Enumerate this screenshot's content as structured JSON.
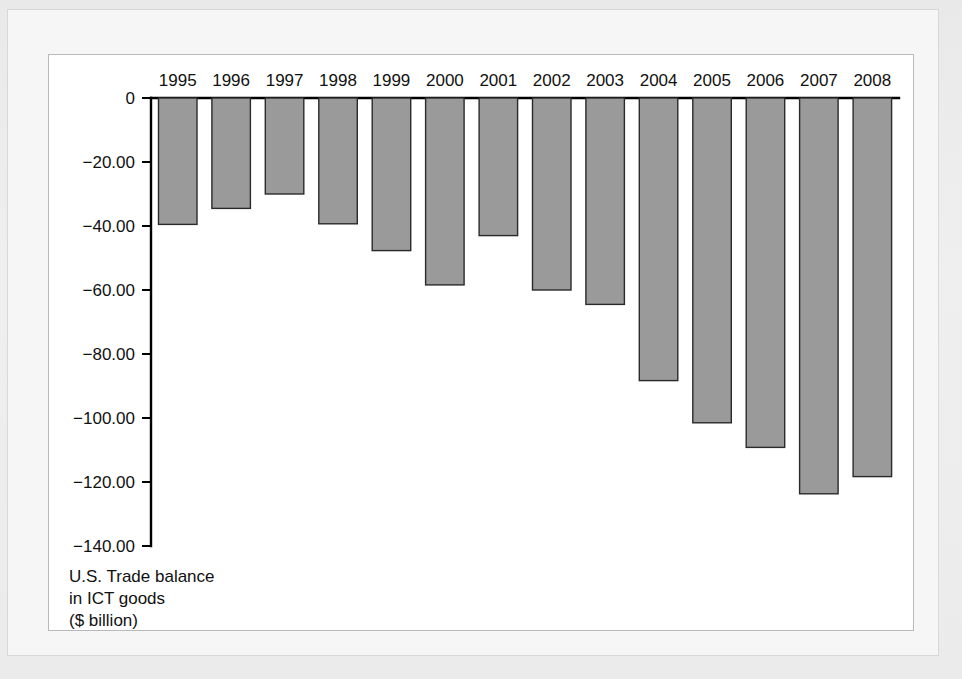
{
  "chart_data": {
    "type": "bar",
    "title": "",
    "subtitle": "",
    "caption_lines": [
      "U.S. Trade balance",
      "in ICT goods",
      "($ billion)"
    ],
    "xlabel": "",
    "ylabel": "",
    "categories": [
      "1995",
      "1996",
      "1997",
      "1998",
      "1999",
      "2000",
      "2001",
      "2002",
      "2003",
      "2004",
      "2005",
      "2006",
      "2007",
      "2008"
    ],
    "values": [
      -39.5,
      -34.5,
      -30.0,
      -39.3,
      -47.7,
      -58.4,
      -43.0,
      -60.0,
      -64.5,
      -88.3,
      -101.5,
      -109.2,
      -123.7,
      -118.3
    ],
    "ylim": [
      -140,
      0
    ],
    "ytick_values": [
      0,
      -20,
      -40,
      -60,
      -80,
      -100,
      -120,
      -140
    ],
    "ytick_labels": [
      "0",
      "−20.00",
      "−40.00",
      "−60.00",
      "−80.00",
      "−100.00",
      "−120.00",
      "−140.00"
    ],
    "xtick_position": "top",
    "grid": false,
    "legend": null,
    "bar_fill_color": "#9a9a9a",
    "bar_border_color": "#2a2a2a",
    "axis_color": "#000000",
    "panel_background": "#ffffff"
  },
  "figure": {
    "mat_color": "#f6f6f6",
    "page_color": "#ececec",
    "frame_border_color": "#b9b9b9"
  }
}
